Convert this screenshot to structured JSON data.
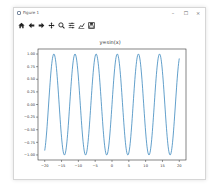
{
  "window": {
    "title": "Figure 1",
    "controls": {
      "minimize": "–",
      "maximize": "☐",
      "close": "×"
    }
  },
  "toolbar": {
    "items": [
      {
        "name": "home",
        "icon": "home-icon"
      },
      {
        "name": "back",
        "icon": "arrow-left-icon"
      },
      {
        "name": "forward",
        "icon": "arrow-right-icon"
      },
      {
        "name": "pan",
        "icon": "move-icon"
      },
      {
        "name": "zoom",
        "icon": "zoom-icon"
      },
      {
        "name": "configure-subplots",
        "icon": "sliders-icon"
      },
      {
        "name": "edit-axis",
        "icon": "line-chart-icon"
      },
      {
        "name": "save",
        "icon": "save-icon"
      }
    ]
  },
  "chart_data": {
    "type": "line",
    "title": "y=sin(x)",
    "xlabel": "",
    "ylabel": "",
    "xlim": [
      -22,
      22
    ],
    "ylim": [
      -1.1,
      1.1
    ],
    "xticks": [
      -20,
      -15,
      -10,
      -5,
      0,
      5,
      10,
      15,
      20
    ],
    "xtick_labels": [
      "−20",
      "−15",
      "−10",
      "−5",
      "0",
      "5",
      "10",
      "15",
      "20"
    ],
    "yticks": [
      -1.0,
      -0.75,
      -0.5,
      -0.25,
      0.0,
      0.25,
      0.5,
      0.75,
      1.0
    ],
    "ytick_labels": [
      "−1.00",
      "−0.75",
      "−0.50",
      "−0.25",
      "0.00",
      "0.25",
      "0.50",
      "0.75",
      "1.00"
    ],
    "grid": false,
    "legend": null,
    "series": [
      {
        "name": "sin(x)",
        "function": "sin(x)",
        "x_range": [
          -20,
          20
        ],
        "color": "#1f77b4",
        "start_point": [
          -20,
          -0.913
        ],
        "end_point": [
          20,
          0.913
        ]
      }
    ]
  },
  "colors": {
    "line": "#1f77b4",
    "axes": "#333333",
    "window_border": "#d6d6d6"
  }
}
